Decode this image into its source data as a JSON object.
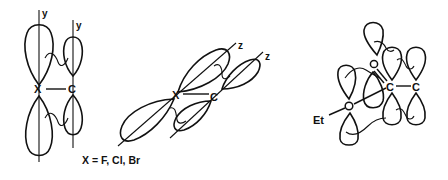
{
  "diagram": {
    "type": "orbital-interaction",
    "ink_color": "#111111",
    "background": "#ffffff",
    "panels": [
      {
        "id": "halide-pi-y",
        "atoms": [
          "X",
          "C"
        ],
        "axis_labels": [
          "y",
          "y"
        ],
        "description": "p_y orbitals on X and C, side-by-side overlap"
      },
      {
        "id": "halide-pi-z",
        "atoms": [
          "X",
          "C"
        ],
        "axis_labels": [
          "z",
          "z"
        ],
        "caption": "X = F, Cl, Br",
        "description": "p_z orbitals tilted, shown in perspective"
      },
      {
        "id": "ethoxy-carbonyl",
        "atoms": [
          "O",
          "C",
          "C",
          "O"
        ],
        "substituent": "Et",
        "description": "ethoxy O lone pairs interacting with C=C p orbitals and carbonyl O"
      }
    ]
  }
}
